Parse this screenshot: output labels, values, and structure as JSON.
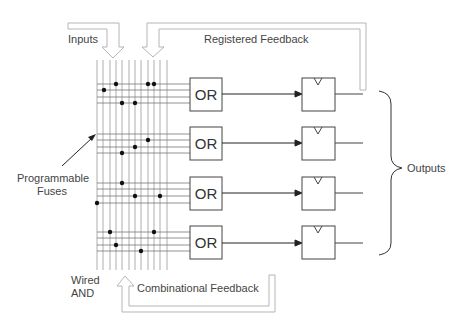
{
  "diagram": {
    "labels": {
      "inputs": "Inputs",
      "registered_feedback": "Registered Feedback",
      "programmable_fuses_line1": "Programmable",
      "programmable_fuses_line2": "Fuses",
      "outputs": "Outputs",
      "wired_and_line1": "Wired",
      "wired_and_line2": "AND",
      "combinational_feedback": "Combinational Feedback"
    },
    "or_gate_label": "OR",
    "blocks": [
      {
        "or_label": "OR",
        "flip_flop": "D-FF",
        "output": "out-1"
      },
      {
        "or_label": "OR",
        "flip_flop": "D-FF",
        "output": "out-2"
      },
      {
        "or_label": "OR",
        "flip_flop": "D-FF",
        "output": "out-3"
      },
      {
        "or_label": "OR",
        "flip_flop": "D-FF",
        "output": "out-4"
      }
    ],
    "colors": {
      "line": "#444444",
      "grid": "#9a9a9a",
      "arrow_outline": "#b5b5b5",
      "text": "#444444",
      "dot": "#111111"
    }
  }
}
